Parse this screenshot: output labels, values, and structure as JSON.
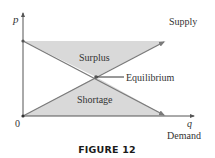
{
  "figure": {
    "caption": "FIGURE 12",
    "axes": {
      "y_label": "p",
      "x_label": "q",
      "origin_label": "0"
    },
    "curves": {
      "supply_label": "Supply",
      "demand_label": "Demand"
    },
    "regions": {
      "surplus_label": "Surplus",
      "shortage_label": "Shortage"
    },
    "annotation": {
      "equilibrium_label": "Equilibrium"
    },
    "colors": {
      "fill": "#d9d9d9",
      "line": "#7a7a7a",
      "axis": "#555555",
      "text": "#333333"
    }
  }
}
